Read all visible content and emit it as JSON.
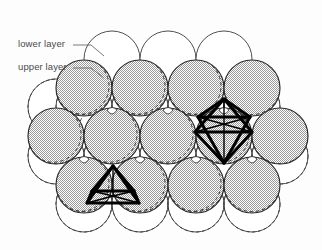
{
  "figure": {
    "labels": {
      "lower_layer": "lower layer",
      "upper_layer": "upper layer"
    },
    "colors": {
      "background": "#ffffff",
      "lower_layer_fill": "#ffffff",
      "lower_layer_stroke": "#3a3a3a",
      "upper_layer_fill": "#d8d8d8",
      "upper_layer_stroke": "#2b2b2b",
      "hidden_arc_stroke": "#3a3a3a",
      "polyhedron_stroke": "#000000",
      "label_text": "#4a4a4a",
      "leader_line": "#6a6a6a"
    },
    "geometry": {
      "sphere_radius": 28,
      "row_spacing": 48.5,
      "col_spacing": 56,
      "origin_x": 112,
      "origin_y": 59
    },
    "lower_layer_circles": [
      {
        "cx": 112,
        "cy": 59
      },
      {
        "cx": 168,
        "cy": 59
      },
      {
        "cx": 224,
        "cy": 59
      },
      {
        "cx": 56,
        "cy": 107
      },
      {
        "cx": 252,
        "cy": 107
      },
      {
        "cx": 56,
        "cy": 156
      },
      {
        "cx": 280,
        "cy": 156
      },
      {
        "cx": 84,
        "cy": 204
      },
      {
        "cx": 140,
        "cy": 204
      },
      {
        "cx": 196,
        "cy": 204
      },
      {
        "cx": 252,
        "cy": 204
      },
      {
        "cx": 84,
        "cy": 107
      },
      {
        "cx": 140,
        "cy": 107
      },
      {
        "cx": 196,
        "cy": 107
      },
      {
        "cx": 112,
        "cy": 156
      },
      {
        "cx": 168,
        "cy": 156
      },
      {
        "cx": 224,
        "cy": 156
      }
    ],
    "upper_layer_circles": [
      {
        "cx": 84,
        "cy": 88
      },
      {
        "cx": 140,
        "cy": 88
      },
      {
        "cx": 196,
        "cy": 88
      },
      {
        "cx": 252,
        "cy": 88
      },
      {
        "cx": 56,
        "cy": 136
      },
      {
        "cx": 112,
        "cy": 136
      },
      {
        "cx": 168,
        "cy": 136
      },
      {
        "cx": 224,
        "cy": 136
      },
      {
        "cx": 280,
        "cy": 136
      },
      {
        "cx": 84,
        "cy": 185
      },
      {
        "cx": 140,
        "cy": 185
      },
      {
        "cx": 196,
        "cy": 185
      },
      {
        "cx": 252,
        "cy": 185
      }
    ],
    "tetrahedron": {
      "name": "tetrahedral-hole",
      "apex": [
        113,
        166
      ],
      "left": [
        87,
        203
      ],
      "right": [
        139,
        203
      ],
      "center": [
        113,
        187
      ]
    },
    "octahedron": {
      "name": "octahedral-hole",
      "top": [
        224,
        99
      ],
      "left": [
        195,
        132
      ],
      "right": [
        252,
        132
      ],
      "bottom": [
        224,
        163
      ],
      "mid_left": [
        198,
        117
      ],
      "mid_right": [
        250,
        117
      ]
    }
  }
}
